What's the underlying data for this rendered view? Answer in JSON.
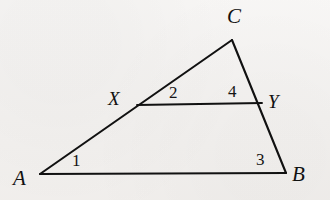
{
  "figure": {
    "kind": "geometry-diagram",
    "background_color": "#f4f2f0",
    "stroke_color": "#111111",
    "stroke_width": 2,
    "canvas": {
      "width": 330,
      "height": 200
    }
  },
  "points": {
    "A": {
      "label": "A",
      "x": 40,
      "y": 174
    },
    "B": {
      "label": "B",
      "x": 286,
      "y": 173
    },
    "C": {
      "label": "C",
      "x": 232,
      "y": 40
    },
    "X": {
      "label": "X",
      "x": 137,
      "y": 105
    },
    "Y": {
      "label": "Y",
      "x": 262,
      "y": 103
    }
  },
  "segments": [
    {
      "name": "side-AB",
      "from": "A",
      "to": "B"
    },
    {
      "name": "side-AC",
      "from": "A",
      "to": "C"
    },
    {
      "name": "side-BC",
      "from": "B",
      "to": "C"
    },
    {
      "name": "segment-XY",
      "from": "X",
      "to": "Y"
    }
  ],
  "angles": [
    {
      "id": "1",
      "label": "1",
      "at_vertex": "A",
      "between": "AB and AC"
    },
    {
      "id": "2",
      "label": "2",
      "at_vertex": "X",
      "between": "XC and XY"
    },
    {
      "id": "3",
      "label": "3",
      "at_vertex": "B",
      "between": "BA and BC"
    },
    {
      "id": "4",
      "label": "4",
      "at_vertex": "Y",
      "between": "YX and YC"
    }
  ]
}
